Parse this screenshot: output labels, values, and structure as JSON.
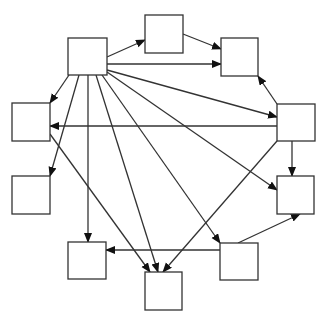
{
  "diagram": {
    "type": "directed-graph",
    "stroke_color": "#333333",
    "arrow_color": "#111111",
    "box_fill": "#ffffff",
    "nodes": [
      {
        "id": "A",
        "label": "",
        "x": 68,
        "y": 38,
        "w": 39,
        "h": 37
      },
      {
        "id": "B",
        "label": "",
        "x": 145,
        "y": 15,
        "w": 38,
        "h": 38
      },
      {
        "id": "C",
        "label": "",
        "x": 221,
        "y": 38,
        "w": 37,
        "h": 38
      },
      {
        "id": "D",
        "label": "",
        "x": 277,
        "y": 104,
        "w": 38,
        "h": 37
      },
      {
        "id": "E",
        "label": "",
        "x": 12,
        "y": 103,
        "w": 38,
        "h": 38
      },
      {
        "id": "F",
        "label": "",
        "x": 12,
        "y": 176,
        "w": 38,
        "h": 38
      },
      {
        "id": "G",
        "label": "",
        "x": 277,
        "y": 176,
        "w": 37,
        "h": 38
      },
      {
        "id": "H",
        "label": "",
        "x": 220,
        "y": 243,
        "w": 38,
        "h": 37
      },
      {
        "id": "I",
        "label": "",
        "x": 68,
        "y": 242,
        "w": 38,
        "h": 37
      },
      {
        "id": "J",
        "label": "",
        "x": 145,
        "y": 272,
        "w": 37,
        "h": 38
      }
    ],
    "edges": [
      {
        "from": "A",
        "to": "B",
        "x1": 107,
        "y1": 57,
        "x2": 145,
        "y2": 40
      },
      {
        "from": "B",
        "to": "C",
        "x1": 183,
        "y1": 34,
        "x2": 221,
        "y2": 49
      },
      {
        "from": "A",
        "to": "C",
        "x1": 107,
        "y1": 64,
        "x2": 221,
        "y2": 64
      },
      {
        "from": "A",
        "to": "D",
        "x1": 107,
        "y1": 70,
        "x2": 277,
        "y2": 117
      },
      {
        "from": "D",
        "to": "C",
        "x1": 277,
        "y1": 104,
        "x2": 258,
        "y2": 76
      },
      {
        "from": "D",
        "to": "E",
        "x1": 277,
        "y1": 126,
        "x2": 50,
        "y2": 126
      },
      {
        "from": "D",
        "to": "G",
        "x1": 292,
        "y1": 141,
        "x2": 292,
        "y2": 176
      },
      {
        "from": "D",
        "to": "J",
        "x1": 277,
        "y1": 141,
        "x2": 163,
        "y2": 272
      },
      {
        "from": "A",
        "to": "E",
        "x1": 69,
        "y1": 75,
        "x2": 50,
        "y2": 103
      },
      {
        "from": "A",
        "to": "F",
        "x1": 79,
        "y1": 75,
        "x2": 50,
        "y2": 176
      },
      {
        "from": "A",
        "to": "I",
        "x1": 88,
        "y1": 75,
        "x2": 88,
        "y2": 242
      },
      {
        "from": "A",
        "to": "J",
        "x1": 96,
        "y1": 75,
        "x2": 158,
        "y2": 272
      },
      {
        "from": "A",
        "to": "H",
        "x1": 102,
        "y1": 75,
        "x2": 220,
        "y2": 243
      },
      {
        "from": "A",
        "to": "G",
        "x1": 107,
        "y1": 72,
        "x2": 277,
        "y2": 190
      },
      {
        "from": "E",
        "to": "J",
        "x1": 50,
        "y1": 134,
        "x2": 150,
        "y2": 272
      },
      {
        "from": "H",
        "to": "I",
        "x1": 220,
        "y1": 250,
        "x2": 106,
        "y2": 250
      },
      {
        "from": "H",
        "to": "G",
        "x1": 238,
        "y1": 243,
        "x2": 300,
        "y2": 214
      }
    ]
  }
}
